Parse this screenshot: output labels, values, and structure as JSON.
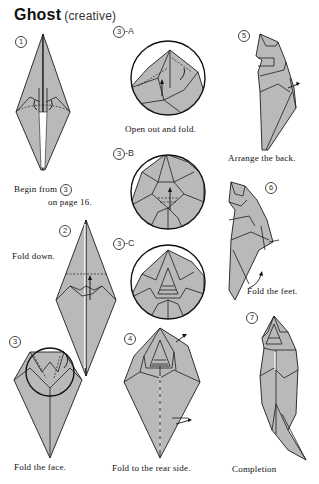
{
  "page": {
    "title": "Ghost",
    "subtitle": "(creative)"
  },
  "steps": [
    {
      "id": "1",
      "label": "1",
      "caption": ""
    },
    {
      "id": "2",
      "label": "2",
      "caption": "Fold down."
    },
    {
      "id": "3",
      "label": "3",
      "caption": "Fold the face."
    },
    {
      "id": "3A",
      "label": "3",
      "suffix": "-A",
      "caption": "Open out and fold."
    },
    {
      "id": "3B",
      "label": "3",
      "suffix": "-B",
      "caption": ""
    },
    {
      "id": "3C",
      "label": "3",
      "suffix": "-C",
      "caption": ""
    },
    {
      "id": "4",
      "label": "4",
      "caption": "Fold to the rear side."
    },
    {
      "id": "5",
      "label": "5",
      "caption": "Arrange the back."
    },
    {
      "id": "6",
      "label": "6",
      "caption": "Fold the feet."
    },
    {
      "id": "7",
      "label": "7",
      "caption": "Completion"
    }
  ],
  "begin_note": {
    "line1": "Begin from",
    "ref_step": "3",
    "line2": "on page 16."
  },
  "colors": {
    "paper": "#b9b9b9",
    "outline": "#1d1d1d",
    "background": "#ffffff"
  }
}
